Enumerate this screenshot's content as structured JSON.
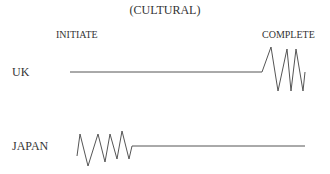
{
  "title": "(CULTURAL)",
  "headers": {
    "start": "INITIATE",
    "end": "COMPLETE"
  },
  "rows": [
    {
      "label": "UK",
      "pattern": "flat line then zigzag at completion"
    },
    {
      "label": "JAPAN",
      "pattern": "zigzag at initiation then flat line"
    }
  ],
  "colors": {
    "line": "#555555",
    "text": "#333333"
  }
}
